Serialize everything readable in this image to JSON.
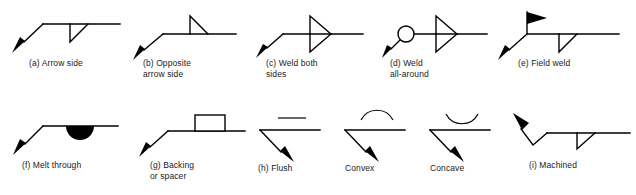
{
  "figure": {
    "background_color": "#ffffff",
    "line_color": "#000000",
    "caption_color": "#1a1a1a",
    "rows": 2,
    "items": [
      {
        "id": "a",
        "letter": "(a)",
        "name": "arrow-side",
        "caption": "(a)  Arrow side",
        "caption_lines": [
          "(a)  Arrow side"
        ],
        "symbol_type": "fillet-weld-below-reference-line",
        "leader_direction": "down-left",
        "arrowhead": "solid-filled",
        "row": 1,
        "column": 1
      },
      {
        "id": "b",
        "letter": "(b)",
        "name": "opposite-arrow-side",
        "caption": "(b)  Opposite\n       arrow side",
        "caption_lines": [
          "(b)  Opposite",
          "arrow side"
        ],
        "symbol_type": "fillet-weld-above-reference-line",
        "leader_direction": "down-left",
        "arrowhead": "solid-filled",
        "row": 1,
        "column": 2
      },
      {
        "id": "c",
        "letter": "(c)",
        "name": "weld-both-sides",
        "caption": "(c)  Weld both\n       sides",
        "caption_lines": [
          "(c)  Weld both",
          "sides"
        ],
        "symbol_type": "fillet-weld-both-sides-double-triangle",
        "leader_direction": "down-left",
        "arrowhead": "solid-filled",
        "row": 1,
        "column": 3
      },
      {
        "id": "d",
        "letter": "(d)",
        "name": "weld-all-around",
        "caption": "(d)  Weld\n       all-around",
        "caption_lines": [
          "(d)  Weld",
          "all-around"
        ],
        "symbol_type": "weld-all-around-circle-with-double-triangle",
        "leader_direction": "down-left",
        "arrowhead": "solid-filled",
        "row": 1,
        "column": 4
      },
      {
        "id": "e",
        "letter": "(e)",
        "name": "field-weld",
        "caption": "(e)  Field weld",
        "caption_lines": [
          "(e)  Field weld"
        ],
        "symbol_type": "field-weld-filled-flag-with-fillet",
        "leader_direction": "down-left",
        "arrowhead": "solid-filled",
        "row": 1,
        "column": 5
      },
      {
        "id": "f",
        "letter": "(f)",
        "name": "melt-through",
        "caption": "(f)  Melt through",
        "caption_lines": [
          "(f)  Melt through"
        ],
        "symbol_type": "melt-through-filled-semicircle",
        "leader_direction": "down-left",
        "arrowhead": "solid-filled",
        "row": 2,
        "column": 1
      },
      {
        "id": "g",
        "letter": "(g)",
        "name": "backing-or-spacer",
        "caption": "(g)  Backing\n       or spacer",
        "caption_lines": [
          "(g)  Backing",
          "or spacer"
        ],
        "symbol_type": "backing-spacer-open-rectangle",
        "leader_direction": "down-left",
        "arrowhead": "solid-filled",
        "row": 2,
        "column": 2
      },
      {
        "id": "h",
        "letter": "(h)",
        "name": "flush",
        "caption": "(h) Flush",
        "caption_lines": [
          "(h) Flush"
        ],
        "symbol_type": "flush-contour-straight-dash",
        "leader_direction": "down-right",
        "arrowhead": "solid-filled",
        "row": 2,
        "column": 3
      },
      {
        "id": "h2",
        "letter": "",
        "name": "convex",
        "caption": "Convex",
        "caption_lines": [
          "Convex"
        ],
        "symbol_type": "convex-contour-arc-up",
        "leader_direction": "down-right",
        "arrowhead": "solid-filled",
        "row": 2,
        "column": 4
      },
      {
        "id": "h3",
        "letter": "",
        "name": "concave",
        "caption": "Concave",
        "caption_lines": [
          "Concave"
        ],
        "symbol_type": "concave-contour-arc-down",
        "leader_direction": "down-right",
        "arrowhead": "solid-filled",
        "row": 2,
        "column": 5
      },
      {
        "id": "i",
        "letter": "(i)",
        "name": "machined",
        "caption": "(i) Machined",
        "caption_lines": [
          "(i) Machined"
        ],
        "symbol_type": "machined-zigzag-leader-with-fillet",
        "leader_direction": "up-left",
        "arrowhead": "solid-filled",
        "row": 2,
        "column": 6
      }
    ]
  }
}
